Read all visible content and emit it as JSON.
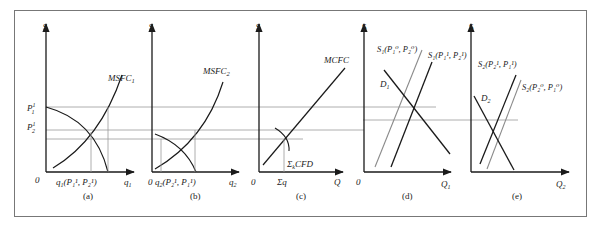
{
  "figure": {
    "panels": [
      {
        "id": "a",
        "caption": "(a)",
        "y_axis_label": "$",
        "x_axis_label": "q₁",
        "origin": "0",
        "curves": [
          "MSFC₁"
        ],
        "price_labels": [
          "P₁¹",
          "P₂¹"
        ],
        "quantity_label": "q₁(P₁¹, P₂¹)"
      },
      {
        "id": "b",
        "caption": "(b)",
        "y_axis_label": "$",
        "x_axis_label": "q₂",
        "origin": "0",
        "curves": [
          "MSFC₂"
        ],
        "quantity_label": "q₂(P₂¹, P₁¹)"
      },
      {
        "id": "c",
        "caption": "(c)",
        "y_axis_label": "$",
        "x_axis_label": "Q",
        "origin": "0",
        "curves": [
          "MCFC",
          "ΣₖCFD"
        ],
        "quantity_label": "Σq"
      },
      {
        "id": "d",
        "caption": "(d)",
        "y_axis_label": "$",
        "x_axis_label": "Q₁",
        "origin": "0",
        "curves": [
          "D₁",
          "S₁(P₁⁰, P₂⁰)",
          "S₁(P₁¹, P₂¹)"
        ]
      },
      {
        "id": "e",
        "caption": "(e)",
        "y_axis_label": "$",
        "x_axis_label": "Q₂",
        "origin": "0",
        "curves": [
          "D₂",
          "S₂(P₂¹, P₁¹)",
          "S₂(P₂⁰, P₁⁰)"
        ]
      }
    ]
  },
  "labels": {
    "dollar": "$",
    "zero": "0",
    "a": {
      "caption": "(a)",
      "msfc": "MSFC",
      "msfc_sub": "1",
      "p1": "P",
      "p1_sup": "1",
      "p1_sub": "1",
      "p2": "P",
      "p2_sup": "1",
      "p2_sub": "2",
      "q_main": "q",
      "q_sub": "1",
      "q_args": "(P₁¹, P₂¹)",
      "xaxis": "q",
      "xaxis_sub": "1"
    },
    "b": {
      "caption": "(b)",
      "msfc": "MSFC",
      "msfc_sub": "2",
      "q_main": "q",
      "q_sub": "2",
      "q_args": "(P₂¹, P₁¹)",
      "xaxis": "q",
      "xaxis_sub": "2"
    },
    "c": {
      "caption": "(c)",
      "mcfc": "MCFC",
      "cfd_sigma": "Σ",
      "cfd_sub": "k",
      "cfd": "CFD",
      "sigma_q": "Σq",
      "xaxis": "Q"
    },
    "d": {
      "caption": "(d)",
      "d1": "D",
      "d1_sub": "1",
      "s_old": "S₁(P₁⁰, P₂⁰)",
      "s_new": "S₁(P₁¹, P₂¹)",
      "xaxis": "Q",
      "xaxis_sub": "1"
    },
    "e": {
      "caption": "(e)",
      "d2": "D",
      "d2_sub": "2",
      "s_new": "S₂(P₂¹, P₁¹)",
      "s_old": "S₂(P₂⁰, P₁⁰)",
      "xaxis": "Q",
      "xaxis_sub": "2"
    }
  },
  "colors": {
    "ink": "#1a1a1a",
    "gray_curve": "#8a8a8a",
    "guide": "#9a9a9a",
    "frame": "#777777"
  }
}
